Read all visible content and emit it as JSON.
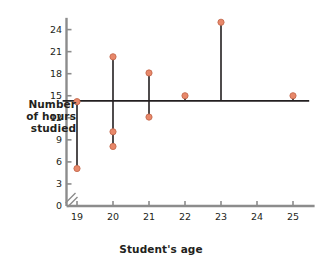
{
  "chart_data": {
    "type": "scatter",
    "title": "",
    "xlabel": "Student's age",
    "ylabel": "Number\nof hours\nstudied",
    "ylabel_lines": [
      "Number",
      "of hours",
      "studied"
    ],
    "xlim": [
      18.5,
      25.5
    ],
    "ylim": [
      0,
      25.8
    ],
    "grid": false,
    "legend": false,
    "axis_break_y": true,
    "x_ticks": [
      19,
      20,
      21,
      22,
      23,
      24,
      25
    ],
    "x_tick_labels": [
      "19",
      "20",
      "21",
      "22",
      "23",
      "24",
      "25"
    ],
    "y_ticks": [
      0,
      3,
      6,
      9,
      12,
      15,
      18,
      21,
      24
    ],
    "y_tick_labels": [
      "0",
      "3",
      "6",
      "9",
      "12",
      "15",
      "18",
      "21",
      "24"
    ],
    "points": [
      {
        "x": 19,
        "y": 14.2
      },
      {
        "x": 19,
        "y": 5.1
      },
      {
        "x": 20,
        "y": 20.3
      },
      {
        "x": 20,
        "y": 10.1
      },
      {
        "x": 20,
        "y": 8.1
      },
      {
        "x": 21,
        "y": 18.1
      },
      {
        "x": 21,
        "y": 12.1
      },
      {
        "x": 22,
        "y": 15.0
      },
      {
        "x": 23,
        "y": 25.0
      },
      {
        "x": 25,
        "y": 15.0
      }
    ],
    "residual_segments": [
      {
        "x": 19,
        "y1": 14.2,
        "y2": 5.1
      },
      {
        "x": 20,
        "y1": 20.3,
        "y2": 8.1
      },
      {
        "x": 21,
        "y1": 18.1,
        "y2": 12.1
      },
      {
        "x": 22,
        "y1": 15.0,
        "y2": 14.3
      },
      {
        "x": 23,
        "y1": 25.0,
        "y2": 14.3
      },
      {
        "x": 25,
        "y1": 15.0,
        "y2": 14.3
      }
    ],
    "regression_line": {
      "name": "horizontal fit line",
      "y": 14.3,
      "x_start": 18.6,
      "x_end": 25.45,
      "slope": 0
    },
    "colors": {
      "point_fill": "#e8886a",
      "point_stroke": "#c46a4e",
      "line": "#231f20",
      "axis": "#8c8c8c",
      "text": "#231f20",
      "background": "#ffffff"
    }
  }
}
